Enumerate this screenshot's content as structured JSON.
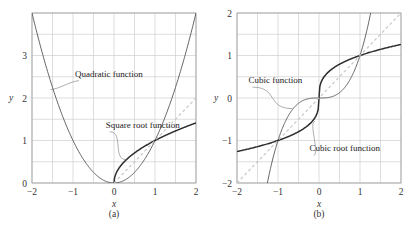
{
  "chart_data": [
    {
      "type": "line",
      "panel_label": "(a)",
      "xlabel": "x",
      "ylabel": "y",
      "xlim": [
        -2,
        2
      ],
      "ylim": [
        0,
        4
      ],
      "xticks": [
        -2,
        -1,
        0,
        1,
        2
      ],
      "yticks": [
        0,
        1,
        2,
        3
      ],
      "grid": true,
      "grid_step": 0.5,
      "series": [
        {
          "name": "Quadratic function",
          "expr": "x^2",
          "domain": [
            -2,
            2
          ],
          "style": "solid-thin",
          "color": "#555555",
          "points": [
            [
              -2,
              4
            ],
            [
              -1.5,
              2.25
            ],
            [
              -1,
              1
            ],
            [
              -0.5,
              0.25
            ],
            [
              0,
              0
            ],
            [
              0.5,
              0.25
            ],
            [
              1,
              1
            ],
            [
              1.5,
              2.25
            ],
            [
              2,
              4
            ]
          ]
        },
        {
          "name": "Square root function",
          "expr": "sqrt(x)",
          "domain": [
            0,
            2
          ],
          "style": "solid-thick",
          "color": "#333333",
          "points": [
            [
              0,
              0
            ],
            [
              0.25,
              0.5
            ],
            [
              0.5,
              0.707
            ],
            [
              1,
              1
            ],
            [
              1.5,
              1.225
            ],
            [
              2,
              1.414
            ]
          ]
        },
        {
          "name": "y = x",
          "expr": "x",
          "domain": [
            0,
            2
          ],
          "style": "dashed",
          "color": "#bbbbbb",
          "points": [
            [
              0,
              0
            ],
            [
              2,
              2
            ]
          ]
        }
      ],
      "annotations": [
        {
          "text": "Quadratic function",
          "x": -0.95,
          "y": 2.5,
          "points_to": [
            -1.55,
            2.2
          ]
        },
        {
          "text": "Square root function",
          "x": -0.2,
          "y": 1.3,
          "points_to": [
            0.3,
            0.55
          ]
        }
      ]
    },
    {
      "type": "line",
      "panel_label": "(b)",
      "xlabel": "x",
      "ylabel": "y",
      "xlim": [
        -2,
        2
      ],
      "ylim": [
        -2,
        2
      ],
      "xticks": [
        -2,
        -1,
        0,
        1,
        2
      ],
      "yticks": [
        -2,
        -1,
        0,
        1,
        2
      ],
      "grid": true,
      "grid_step": 0.5,
      "series": [
        {
          "name": "Cubic function",
          "expr": "x^3",
          "domain": [
            -1.26,
            1.26
          ],
          "style": "solid-thin",
          "color": "#555555",
          "points": [
            [
              -1.26,
              -2
            ],
            [
              -1,
              -1
            ],
            [
              -0.5,
              -0.125
            ],
            [
              0,
              0
            ],
            [
              0.5,
              0.125
            ],
            [
              1,
              1
            ],
            [
              1.26,
              2
            ]
          ]
        },
        {
          "name": "Cubic root function",
          "expr": "cbrt(x)",
          "domain": [
            -2,
            2
          ],
          "style": "solid-thick",
          "color": "#333333",
          "points": [
            [
              -2,
              -1.26
            ],
            [
              -1,
              -1
            ],
            [
              -0.5,
              -0.794
            ],
            [
              0,
              0
            ],
            [
              0.5,
              0.794
            ],
            [
              1,
              1
            ],
            [
              2,
              1.26
            ]
          ]
        },
        {
          "name": "y = x",
          "expr": "x",
          "domain": [
            -2,
            2
          ],
          "style": "dashed",
          "color": "#bbbbbb",
          "points": [
            [
              -2,
              -2
            ],
            [
              2,
              2
            ]
          ]
        }
      ],
      "annotations": [
        {
          "text": "Cubic function",
          "x": -1.72,
          "y": 0.35,
          "points_to": [
            -0.65,
            -0.25
          ]
        },
        {
          "text": "Cubic root function",
          "x": -0.23,
          "y": -1.25,
          "points_to": [
            -0.1,
            -0.55
          ]
        }
      ]
    }
  ],
  "layout": {
    "panels": [
      {
        "left": 32,
        "top": 13,
        "width": 164,
        "height": 170
      },
      {
        "left": 237,
        "top": 13,
        "width": 164,
        "height": 170
      }
    ],
    "colors": {
      "grid": "#cfcfcf",
      "frame": "#999999",
      "thin": "#555555",
      "thick": "#2e2e2e",
      "dashed": "#c4c4c4"
    }
  }
}
